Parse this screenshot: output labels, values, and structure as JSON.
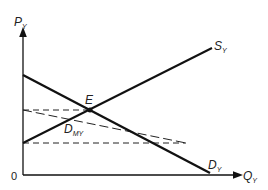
{
  "axes": {
    "y_label_main": "P",
    "y_label_sub": "Y",
    "x_label_main": "Q",
    "x_label_sub": "Y",
    "origin_label": "0"
  },
  "curves": {
    "supply": {
      "label_main": "S",
      "label_sub": "Y"
    },
    "demand": {
      "label_main": "D",
      "label_sub": "Y"
    },
    "marginal_demand": {
      "label_main": "D",
      "label_sub": "MY"
    }
  },
  "points": {
    "equilibrium": {
      "label": "E"
    }
  },
  "colors": {
    "line": "#111111",
    "background": "#ffffff"
  }
}
